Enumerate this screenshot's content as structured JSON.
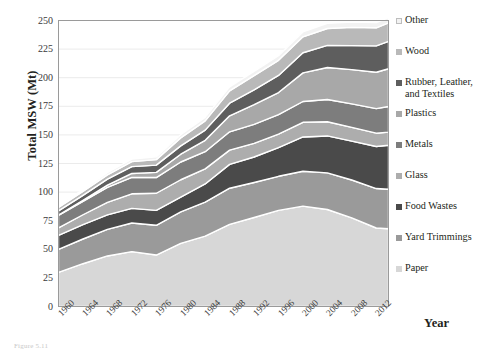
{
  "axes": {
    "ylabel": "Total MSW (Mt)",
    "xlabel": "Year",
    "yticks": [
      "250",
      "225",
      "200",
      "175",
      "150",
      "125",
      "100",
      "75",
      "50",
      "25",
      "0"
    ],
    "xticks": [
      "1960",
      "1964",
      "1968",
      "1972",
      "1976",
      "1980",
      "1984",
      "1988",
      "1992",
      "1996",
      "2000",
      "2004",
      "2008",
      "2012"
    ]
  },
  "caption": "Figure 5.11",
  "legend": {
    "items": [
      {
        "label": "Other",
        "color": "#f2f2f2"
      },
      {
        "label": "Wood",
        "color": "#b9b9b9"
      },
      {
        "label": "Rubber, Leather,\nand Textiles",
        "color": "#5e5e5e"
      },
      {
        "label": "Plastics",
        "color": "#a8a8a8"
      },
      {
        "label": "Metals",
        "color": "#7d7d7d"
      },
      {
        "label": "Glass",
        "color": "#adadad"
      },
      {
        "label": "Food Wastes",
        "color": "#4a4a4a"
      },
      {
        "label": "Yard Trimmings",
        "color": "#9a9a9a"
      },
      {
        "label": "Paper",
        "color": "#d7d7d7"
      }
    ]
  },
  "chart_data": {
    "type": "area",
    "stacked": true,
    "title": "",
    "xlabel": "Year",
    "ylabel": "Total MSW (Mt)",
    "ylim": [
      0,
      250
    ],
    "xlim": [
      1960,
      2014
    ],
    "grid": true,
    "legend_position": "right",
    "x": [
      1960,
      1964,
      1968,
      1972,
      1976,
      1980,
      1984,
      1988,
      1992,
      1996,
      2000,
      2004,
      2008,
      2012,
      2014
    ],
    "series": [
      {
        "name": "Paper",
        "color": "#d7d7d7",
        "values": [
          29.9,
          37.4,
          44.2,
          48.0,
          45.0,
          55.2,
          61.5,
          71.8,
          77.8,
          84.0,
          87.7,
          84.8,
          77.4,
          68.6,
          68.0
        ]
      },
      {
        "name": "Yard Trimmings",
        "color": "#9a9a9a",
        "values": [
          20.0,
          21.6,
          23.2,
          25.0,
          26.0,
          27.5,
          29.8,
          31.6,
          30.6,
          29.8,
          30.5,
          32.0,
          33.2,
          34.5,
          34.5
        ]
      },
      {
        "name": "Food Wastes",
        "color": "#4a4a4a",
        "values": [
          12.2,
          12.5,
          12.7,
          12.8,
          13.0,
          13.0,
          15.8,
          20.8,
          22.3,
          25.0,
          30.0,
          32.3,
          34.0,
          36.8,
          38.4
        ]
      },
      {
        "name": "Glass",
        "color": "#adadad",
        "values": [
          6.7,
          8.7,
          10.9,
          12.7,
          15.0,
          15.1,
          13.2,
          12.5,
          11.9,
          11.8,
          12.8,
          12.4,
          12.0,
          11.6,
          11.5
        ]
      },
      {
        "name": "Metals",
        "color": "#7d7d7d",
        "values": [
          10.8,
          11.6,
          13.1,
          14.3,
          13.7,
          15.5,
          15.0,
          16.0,
          16.6,
          17.1,
          18.2,
          19.4,
          20.5,
          21.5,
          22.4
        ]
      },
      {
        "name": "Plastics",
        "color": "#a8a8a8",
        "values": [
          0.4,
          1.0,
          2.0,
          3.5,
          4.5,
          6.8,
          10.0,
          14.0,
          17.2,
          19.3,
          25.0,
          28.0,
          30.0,
          31.8,
          33.0
        ]
      },
      {
        "name": "Rubber, Leather, and Textiles",
        "color": "#5e5e5e",
        "values": [
          3.6,
          4.4,
          5.2,
          6.0,
          6.4,
          7.3,
          8.9,
          11.0,
          13.0,
          15.0,
          17.6,
          19.3,
          20.9,
          23.0,
          24.0
        ]
      },
      {
        "name": "Wood",
        "color": "#b9b9b9",
        "values": [
          3.0,
          3.4,
          3.8,
          4.3,
          4.8,
          7.0,
          8.1,
          10.8,
          12.4,
          13.2,
          13.9,
          14.8,
          16.0,
          15.8,
          16.1
        ]
      },
      {
        "name": "Other",
        "color": "#f2f2f2",
        "values": [
          1.3,
          1.6,
          1.9,
          2.2,
          2.4,
          2.7,
          3.0,
          3.5,
          3.8,
          4.0,
          4.3,
          4.6,
          4.6,
          4.6,
          4.7
        ]
      }
    ]
  }
}
